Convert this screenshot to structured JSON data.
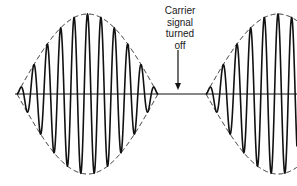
{
  "diagram": {
    "title": "",
    "annotation": {
      "lines": [
        "Carrier",
        "signal",
        "turned",
        "off"
      ],
      "arrow_target": "baseline gap between bursts"
    },
    "colors": {
      "stroke": "#111111",
      "background": "#ffffff"
    },
    "baseline": {
      "y": 94,
      "x_start": 15,
      "x_end": 297
    },
    "bursts": [
      {
        "name": "left-burst",
        "x_start": 17,
        "x_end": 158,
        "amplitude": 80,
        "cycles": 10.5,
        "envelope": "full"
      },
      {
        "name": "right-burst",
        "x_start": 206,
        "x_end": 350,
        "amplitude": 80,
        "cycles": 10.5,
        "envelope": "rising-cut"
      }
    ],
    "arrow": {
      "x": 178,
      "y_top": 50,
      "y_bottom": 90
    }
  }
}
